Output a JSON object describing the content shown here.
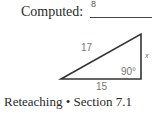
{
  "header": {
    "label": "Computed:",
    "answer": "8"
  },
  "triangle": {
    "hypotenuse_label": "17",
    "base_label": "15",
    "side_label": "x",
    "right_angle_label": "90°",
    "stroke_color": "#333333"
  },
  "footer": {
    "text": "Reteaching • Section 7.1"
  }
}
